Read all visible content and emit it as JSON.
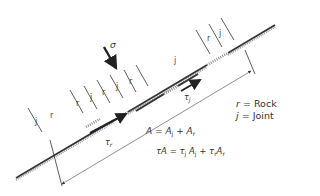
{
  "diagram": {
    "stress_label": "σ",
    "shear_joint_label": "τ",
    "shear_joint_sub": "j",
    "shear_rock_label": "τ",
    "shear_rock_sub": "r",
    "segment_labels": [
      "j",
      "r",
      "j",
      "r",
      "j",
      "r",
      "j",
      "r",
      "j",
      "r",
      "j"
    ],
    "colors": {
      "line": "#333333",
      "hatch": "#888888",
      "background": "#ffffff"
    }
  },
  "legend": {
    "rock": {
      "symbol": "r",
      "text": "= Rock"
    },
    "joint": {
      "symbol": "j",
      "text": "= Joint"
    }
  },
  "equations": {
    "area": {
      "lhs": "A",
      "eq": " = ",
      "t1": "A",
      "s1": "j",
      "plus": " + ",
      "t2": "A",
      "s2": "r"
    },
    "force": {
      "lhs": "τA",
      "eq": " = ",
      "t1": "τ",
      "s1": "j",
      "t1b": "A",
      "s1b": "j",
      "plus": " + ",
      "t2": "τ",
      "s2": "r",
      "t2b": "A",
      "s2b": "r"
    }
  }
}
